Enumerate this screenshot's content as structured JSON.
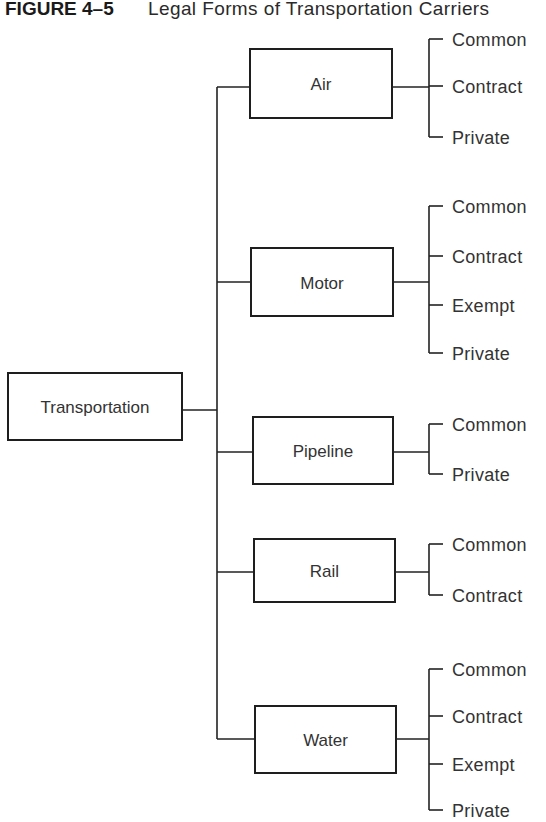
{
  "figure": {
    "number": "FIGURE 4–5",
    "title": "Legal Forms of Transportation Carriers"
  },
  "root": {
    "label": "Transportation",
    "box": {
      "x": 8,
      "y": 373,
      "w": 174,
      "h": 67
    },
    "connector_y": 410
  },
  "trunk_x": 217,
  "branch_x": 429,
  "tick_end_x": 443,
  "leaf_text_x": 452,
  "modes": [
    {
      "label": "Air",
      "box": {
        "x": 250,
        "y": 49,
        "w": 142,
        "h": 69
      },
      "connector_y": 87,
      "carriers": [
        {
          "label": "Common",
          "y": 39
        },
        {
          "label": "Contract",
          "y": 86
        },
        {
          "label": "Private",
          "y": 137
        }
      ]
    },
    {
      "label": "Motor",
      "box": {
        "x": 251,
        "y": 248,
        "w": 142,
        "h": 68
      },
      "connector_y": 282,
      "carriers": [
        {
          "label": "Common",
          "y": 206
        },
        {
          "label": "Contract",
          "y": 256
        },
        {
          "label": "Exempt",
          "y": 305
        },
        {
          "label": "Private",
          "y": 353
        }
      ]
    },
    {
      "label": "Pipeline",
      "box": {
        "x": 253,
        "y": 417,
        "w": 140,
        "h": 67
      },
      "connector_y": 452,
      "carriers": [
        {
          "label": "Common",
          "y": 424
        },
        {
          "label": "Private",
          "y": 474
        }
      ]
    },
    {
      "label": "Rail",
      "box": {
        "x": 254,
        "y": 539,
        "w": 141,
        "h": 63
      },
      "connector_y": 572,
      "carriers": [
        {
          "label": "Common",
          "y": 544
        },
        {
          "label": "Contract",
          "y": 595
        }
      ]
    },
    {
      "label": "Water",
      "box": {
        "x": 255,
        "y": 706,
        "w": 141,
        "h": 67
      },
      "connector_y": 739,
      "carriers": [
        {
          "label": "Common",
          "y": 669
        },
        {
          "label": "Contract",
          "y": 716
        },
        {
          "label": "Exempt",
          "y": 764
        },
        {
          "label": "Private",
          "y": 810
        }
      ]
    }
  ]
}
